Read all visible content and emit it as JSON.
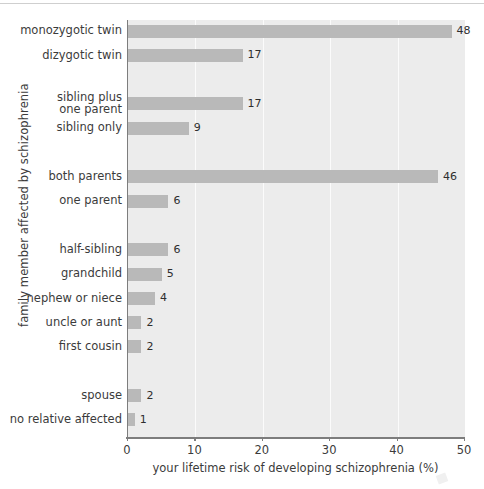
{
  "chart_data": {
    "type": "bar",
    "orientation": "horizontal",
    "title": "",
    "xlabel": "your lifetime risk of developing schizophrenia (%)",
    "ylabel": "family member affected by schizophrenia",
    "xlim": [
      0,
      50
    ],
    "xticks": [
      0,
      10,
      20,
      30,
      40,
      50
    ],
    "grid": true,
    "legend": null,
    "categories": [
      "monozygotic twin",
      "dizygotic twin",
      "sibling plus\none parent",
      "sibling only",
      "both parents",
      "one parent",
      "half-sibling",
      "grandchild",
      "nephew or niece",
      "uncle or aunt",
      "first cousin",
      "spouse",
      "no relative affected"
    ],
    "values": [
      48,
      17,
      17,
      9,
      46,
      6,
      6,
      5,
      4,
      2,
      2,
      2,
      1
    ],
    "value_labels": [
      "48",
      "17",
      "17",
      "9",
      "46",
      "6",
      "6",
      "5",
      "4",
      "2",
      "2",
      "2",
      "1"
    ],
    "bars": [
      {
        "label": "monozygotic twin",
        "value": 48,
        "value_label": "48",
        "row": 0,
        "label_lines": [
          "monozygotic twin"
        ]
      },
      {
        "label": "dizygotic twin",
        "value": 17,
        "value_label": "17",
        "row": 1,
        "label_lines": [
          "dizygotic twin"
        ]
      },
      {
        "label": "sibling plus one parent",
        "value": 17,
        "value_label": "17",
        "row": 3,
        "label_lines": [
          "sibling plus",
          "one parent"
        ]
      },
      {
        "label": "sibling only",
        "value": 9,
        "value_label": "9",
        "row": 4,
        "label_lines": [
          "sibling only"
        ]
      },
      {
        "label": "both parents",
        "value": 46,
        "value_label": "46",
        "row": 6,
        "label_lines": [
          "both parents"
        ]
      },
      {
        "label": "one parent",
        "value": 6,
        "value_label": "6",
        "row": 7,
        "label_lines": [
          "one parent"
        ]
      },
      {
        "label": "half-sibling",
        "value": 6,
        "value_label": "6",
        "row": 9,
        "label_lines": [
          "half-sibling"
        ]
      },
      {
        "label": "grandchild",
        "value": 5,
        "value_label": "5",
        "row": 10,
        "label_lines": [
          "grandchild"
        ]
      },
      {
        "label": "nephew or niece",
        "value": 4,
        "value_label": "4",
        "row": 11,
        "label_lines": [
          "nephew or niece"
        ]
      },
      {
        "label": "uncle or aunt",
        "value": 2,
        "value_label": "2",
        "row": 12,
        "label_lines": [
          "uncle or aunt"
        ]
      },
      {
        "label": "first cousin",
        "value": 2,
        "value_label": "2",
        "row": 13,
        "label_lines": [
          "first cousin"
        ]
      },
      {
        "label": "spouse",
        "value": 2,
        "value_label": "2",
        "row": 15,
        "label_lines": [
          "spouse"
        ]
      },
      {
        "label": "no relative affected",
        "value": 1,
        "value_label": "1",
        "row": 16,
        "label_lines": [
          "no relative affected"
        ]
      }
    ],
    "colors": {
      "bar_fill": "#b9b9b9",
      "plot_background": "#ececec",
      "gridline": "#fbfbfb",
      "axis_line": "#7d7d7d",
      "text": "#3b3b3b",
      "value_text": "#2e2e2e",
      "page_background": "#ffffff"
    }
  }
}
